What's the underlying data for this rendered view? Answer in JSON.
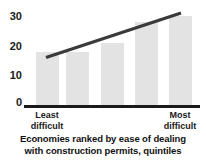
{
  "chart_data": {
    "type": "bar",
    "title": "",
    "caption_line1": "Economies ranked by ease of dealing",
    "caption_line2": "with construction permits, quintiles",
    "xlabel": "Economies ranked by ease of dealing with construction permits, quintiles",
    "ylabel": "",
    "categories": [
      "Least difficult",
      "",
      "",
      "",
      "Most difficult"
    ],
    "category_labels": [
      {
        "line1": "Least",
        "line2": "difficult"
      },
      {
        "line1": "Most",
        "line2": "difficult"
      }
    ],
    "values": [
      18,
      18,
      21,
      28,
      30
    ],
    "ylim": [
      0,
      32
    ],
    "yticks": [
      0,
      10,
      20,
      30
    ],
    "ytick_labels": [
      "0",
      "10",
      "20",
      "30"
    ],
    "grid": false,
    "legend": "none",
    "series": [
      {
        "name": "quintile value",
        "values": [
          18,
          18,
          21,
          28,
          30
        ]
      }
    ],
    "trendline": {
      "type": "line",
      "x_start_value": 1,
      "x_end_value": 5,
      "y_start": 16,
      "y_end": 31
    },
    "colors": {
      "bar_fill": "#e3e3e3",
      "axis": "#1a1a1a",
      "trendline": "#3a3a3a",
      "text": "#1a1a1a",
      "background": "#ffffff"
    }
  }
}
